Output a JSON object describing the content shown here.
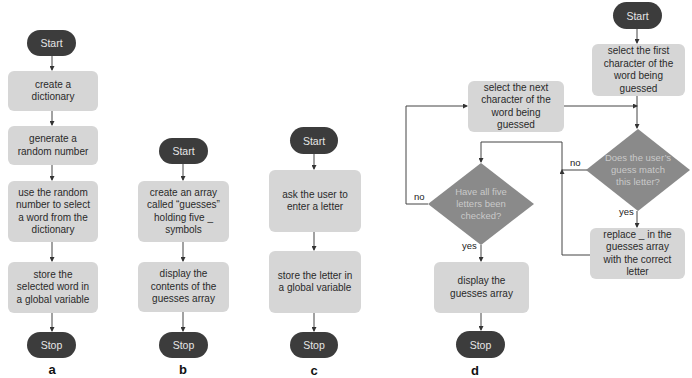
{
  "colors": {
    "terminal": "#3c3c3c",
    "process": "#d6d6d6",
    "decision": "#8a8a8a",
    "line": "#333333"
  },
  "flowcharts": {
    "a": {
      "caption": "a",
      "start": "Start",
      "steps": [
        "create a dictionary",
        "generate a random number",
        "use the random number to select a word from the dictionary",
        "store the selected word in a global variable"
      ],
      "stop": "Stop"
    },
    "b": {
      "caption": "b",
      "start": "Start",
      "steps": [
        "create an array called “guesses” holding five _ symbols",
        "display the contents of the guesses array"
      ],
      "stop": "Stop"
    },
    "c": {
      "caption": "c",
      "start": "Start",
      "steps": [
        "ask the user to enter a letter",
        "store the letter in a global variable"
      ],
      "stop": "Stop"
    },
    "d": {
      "caption": "d",
      "start": "Start",
      "select_first": "select the first character of the word being guessed",
      "select_next": "select the next character of the word being guessed",
      "decision_match": "Does the user’s guess match this letter?",
      "decision_all_checked": "Have all five letters been checked?",
      "replace": "replace _ in the guesses array with the correct letter",
      "display": "display the guesses array",
      "stop": "Stop",
      "labels": {
        "match_no": "no",
        "match_yes": "yes",
        "checked_no": "no",
        "checked_yes": "yes"
      }
    }
  }
}
